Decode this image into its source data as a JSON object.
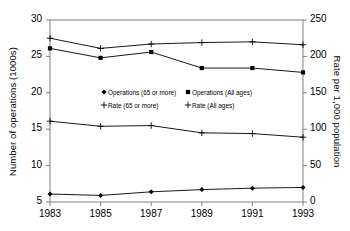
{
  "chart_data": {
    "type": "line",
    "title": "",
    "xlabel": "",
    "ylabel": "Number of operations (1000s)",
    "y2label": "Rate per 1,000 population",
    "x": [
      1983,
      1985,
      1987,
      1989,
      1991,
      1993
    ],
    "xtick_labels": [
      "1983",
      "1985",
      "1987",
      "1989",
      "1991",
      "1993"
    ],
    "ylim": [
      5,
      30
    ],
    "ytick_labels": [
      "5",
      "10",
      "15",
      "20",
      "25",
      "30"
    ],
    "ytick_values": [
      5,
      10,
      15,
      20,
      25,
      30
    ],
    "y2lim": [
      0,
      250
    ],
    "y2tick_labels": [
      "0",
      "50",
      "100",
      "150",
      "200",
      "250"
    ],
    "y2tick_values": [
      0,
      50,
      100,
      150,
      200,
      250
    ],
    "grid": false,
    "legend_position": "center",
    "series": [
      {
        "name": "Operations (65 or more)",
        "axis": "left",
        "marker": "diamond",
        "values": [
          6.1,
          5.9,
          6.4,
          6.7,
          6.9,
          7.0
        ]
      },
      {
        "name": "Operations (All ages)",
        "axis": "left",
        "marker": "square",
        "values": [
          26.1,
          24.8,
          25.6,
          23.4,
          23.4,
          22.8
        ]
      },
      {
        "name": "Rate (65 or more)",
        "axis": "right",
        "marker": "plus",
        "values": [
          111,
          104,
          105,
          95,
          94,
          89
        ]
      },
      {
        "name": "Rate (All ages)",
        "axis": "right",
        "marker": "plus",
        "values": [
          225,
          211,
          217,
          219,
          220,
          216
        ]
      }
    ],
    "legend": [
      "Operations (65 or more)",
      "Operations (All ages)",
      "Rate (65 or more)",
      "Rate (All ages)"
    ]
  },
  "colors": {
    "line": "#000000",
    "frame": "#808080",
    "background": "#ffffff"
  }
}
